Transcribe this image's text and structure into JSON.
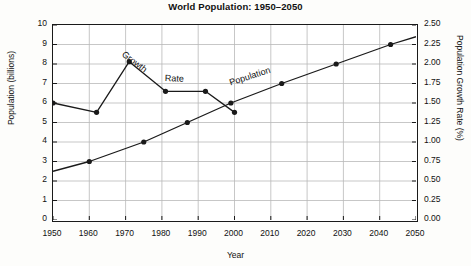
{
  "chart_data": {
    "type": "line",
    "title": "World Population: 1950–2050",
    "xlabel": "Year",
    "ylabel": "Population (billions)",
    "ylabel_right": "Population Growth Rate (%)",
    "xlim": [
      1950,
      2050
    ],
    "ylim": [
      0,
      10
    ],
    "ylim_right": [
      0.0,
      2.5
    ],
    "grid": true,
    "legend": "inline-labels",
    "xticks": [
      1950,
      1960,
      1970,
      1980,
      1990,
      2000,
      2010,
      2020,
      2030,
      2040,
      2050
    ],
    "yticks_left": [
      0,
      1,
      2,
      3,
      4,
      5,
      6,
      7,
      8,
      9,
      10
    ],
    "yticks_right": [
      "0.00",
      "0.25",
      "0.50",
      "0.75",
      "1.00",
      "1.25",
      "1.50",
      "1.75",
      "2.00",
      "2.25",
      "2.50"
    ],
    "series": [
      {
        "name": "Population",
        "axis": "left",
        "units": "billions",
        "inline_label": "Population",
        "marker": "filled-circle",
        "points": [
          {
            "x": 1950,
            "y": 2.5,
            "marker": false
          },
          {
            "x": 1960,
            "y": 3.0,
            "marker": true
          },
          {
            "x": 1975,
            "y": 4.0,
            "marker": true
          },
          {
            "x": 1987,
            "y": 5.0,
            "marker": true
          },
          {
            "x": 1999,
            "y": 6.0,
            "marker": true
          },
          {
            "x": 2013,
            "y": 7.0,
            "marker": true
          },
          {
            "x": 2028,
            "y": 8.0,
            "marker": true
          },
          {
            "x": 2043,
            "y": 9.0,
            "marker": true
          },
          {
            "x": 2050,
            "y": 9.4,
            "marker": false
          }
        ]
      },
      {
        "name": "Growth Rate",
        "axis": "right",
        "units": "%",
        "inline_label_1": "Growth",
        "inline_label_2": "Rate",
        "marker": "filled-circle",
        "points": [
          {
            "x": 1950,
            "y": 1.5,
            "marker": true
          },
          {
            "x": 1962,
            "y": 1.38,
            "marker": true
          },
          {
            "x": 1971,
            "y": 2.03,
            "marker": true
          },
          {
            "x": 1981,
            "y": 1.65,
            "marker": true
          },
          {
            "x": 1992,
            "y": 1.65,
            "marker": true
          },
          {
            "x": 2000,
            "y": 1.38,
            "marker": true
          }
        ]
      }
    ],
    "colors": {
      "line": "#1a1a1a",
      "grid": "#b9b9b9",
      "axis": "#1a1a1a",
      "background": "#ffffff",
      "page": "#fdfdfb"
    }
  }
}
